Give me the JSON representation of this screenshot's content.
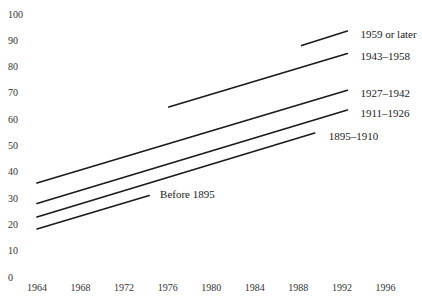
{
  "chart_data": {
    "type": "line",
    "title": "",
    "xlabel": "",
    "ylabel": "",
    "xlim": [
      1964,
      1996
    ],
    "ylim": [
      0,
      100
    ],
    "grid": false,
    "legend": "inline labels at line ends",
    "x_ticks": [
      "1964",
      "1968",
      "1972",
      "1976",
      "1980",
      "1984",
      "1988",
      "1992",
      "1996"
    ],
    "y_ticks": [
      "0",
      "10",
      "20",
      "30",
      "40",
      "50",
      "60",
      "70",
      "80",
      "90",
      "100"
    ],
    "series": [
      {
        "name": "Before 1895",
        "x": [
          1964,
          1974.3
        ],
        "values": [
          18.3,
          31.0
        ],
        "label_pos": [
          1975.3,
          31.5
        ]
      },
      {
        "name": "1895–1910",
        "x": [
          1964,
          1989.5
        ],
        "values": [
          22.8,
          54.7
        ],
        "label_pos": [
          1990.8,
          53.5
        ]
      },
      {
        "name": "1911–1926",
        "x": [
          1964,
          1992.5
        ],
        "values": [
          28.0,
          63.5
        ],
        "label_pos": [
          1993.7,
          62.5
        ]
      },
      {
        "name": "1927–1942",
        "x": [
          1964,
          1992.5
        ],
        "values": [
          35.7,
          71.0
        ],
        "label_pos": [
          1993.7,
          70.0
        ]
      },
      {
        "name": "1943–1958",
        "x": [
          1976.1,
          1992.5
        ],
        "values": [
          64.6,
          85.0
        ],
        "label_pos": [
          1993.7,
          84.0
        ]
      },
      {
        "name": "1959 or later",
        "x": [
          1988.3,
          1992.5
        ],
        "values": [
          88.0,
          93.5
        ],
        "label_pos": [
          1993.7,
          92.5
        ]
      }
    ]
  }
}
